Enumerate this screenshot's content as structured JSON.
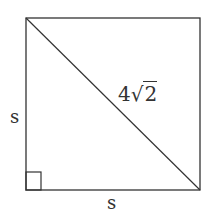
{
  "diagram": {
    "shape": "square",
    "side_label_left": "s",
    "side_label_bottom": "s",
    "diagonal_label": {
      "coefficient": "4",
      "radical": "2"
    },
    "right_angle_marker": "bottom-left",
    "stroke_color": "#333333"
  }
}
